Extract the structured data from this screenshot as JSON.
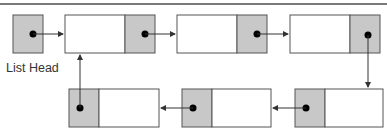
{
  "diagram": {
    "type": "circular-linked-list",
    "head_label": "List Head",
    "colors": {
      "pointer_fill": "#c8c8c8",
      "data_fill": "#ffffff",
      "stroke": "#555555",
      "arrow": "#333333",
      "rule": "#7a7a7a"
    },
    "head": {
      "x": 13,
      "y": 15,
      "w": 30,
      "h": 38
    },
    "nodes": [
      {
        "id": "node-1",
        "x": 65,
        "y": 15,
        "w": 90,
        "h": 38,
        "pointer_side": "right"
      },
      {
        "id": "node-2",
        "x": 177,
        "y": 15,
        "w": 90,
        "h": 38,
        "pointer_side": "right"
      },
      {
        "id": "node-3",
        "x": 290,
        "y": 15,
        "w": 90,
        "h": 38,
        "pointer_side": "right"
      },
      {
        "id": "node-4",
        "x": 295,
        "y": 89,
        "w": 88,
        "h": 38,
        "pointer_side": "left"
      },
      {
        "id": "node-5",
        "x": 182,
        "y": 89,
        "w": 89,
        "h": 38,
        "pointer_side": "left"
      },
      {
        "id": "node-6",
        "x": 69,
        "y": 89,
        "w": 90,
        "h": 38,
        "pointer_side": "left"
      }
    ],
    "edges": [
      {
        "from": "head",
        "to": "node-1"
      },
      {
        "from": "node-1",
        "to": "node-2"
      },
      {
        "from": "node-2",
        "to": "node-3"
      },
      {
        "from": "node-3",
        "to": "node-4"
      },
      {
        "from": "node-4",
        "to": "node-5"
      },
      {
        "from": "node-5",
        "to": "node-6"
      },
      {
        "from": "node-6",
        "to": "node-1"
      }
    ]
  }
}
